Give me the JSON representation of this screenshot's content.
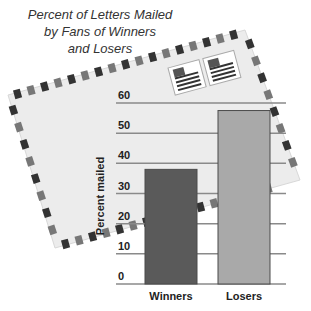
{
  "chart_data": {
    "type": "bar",
    "title": "Percent of Letters Mailed by Fans of Winners and Losers",
    "title_lines": [
      "Percent of Letters Mailed",
      "by Fans of Winners",
      "and Losers"
    ],
    "categories": [
      "Winners",
      "Losers"
    ],
    "values": [
      38,
      57.5
    ],
    "xlabel": "",
    "ylabel": "Percent mailed",
    "ylim": [
      0,
      60
    ],
    "yticks": [
      0,
      10,
      20,
      30,
      40,
      50,
      60
    ],
    "grid": true,
    "legend": null,
    "colors": [
      "#5a5a5a",
      "#a9a9a9"
    ],
    "background": "airmail envelope photo with stamps"
  }
}
